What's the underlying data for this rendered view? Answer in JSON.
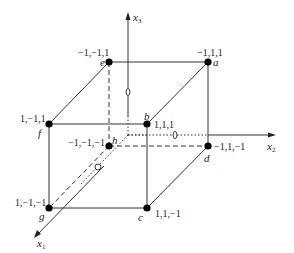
{
  "diagram": {
    "type": "3D cube with coordinate axes",
    "axes": {
      "x1": {
        "name": "x",
        "sub": "1"
      },
      "x2": {
        "name": "x",
        "sub": "2"
      },
      "x3": {
        "name": "x",
        "sub": "3"
      }
    },
    "vertices": {
      "a": {
        "letter": "a",
        "coords": "−1,1,1"
      },
      "b": {
        "letter": "b",
        "coords": "1,1,1"
      },
      "c": {
        "letter": "c",
        "coords": "1,1,−1"
      },
      "d": {
        "letter": "d",
        "coords": "−1,1,−1"
      },
      "e": {
        "letter": "e",
        "coords": "−1,−1,1"
      },
      "f": {
        "letter": "f",
        "coords": "1,−1,1"
      },
      "g": {
        "letter": "g",
        "coords": "1,−1,−1"
      },
      "h": {
        "letter": "h",
        "coords": "−1,−1,−1"
      }
    },
    "colors": {
      "line": "#333333",
      "point": "#000000",
      "background": "#ffffff"
    }
  }
}
